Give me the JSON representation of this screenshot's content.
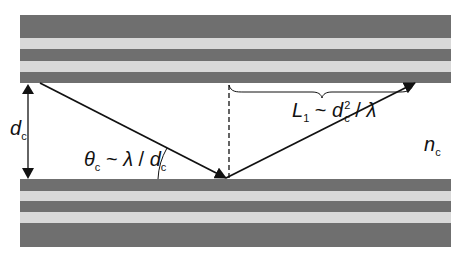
{
  "diagram": {
    "colors": {
      "dark_layer": "#6f6f6f",
      "light_layer": "#d9d9d9",
      "line": "#111111",
      "background": "#ffffff"
    },
    "top_cladding": {
      "layers": [
        {
          "type": "dark",
          "y": 15,
          "h": 23
        },
        {
          "type": "light",
          "y": 38,
          "h": 11
        },
        {
          "type": "dark",
          "y": 49,
          "h": 12
        },
        {
          "type": "light",
          "y": 61,
          "h": 11
        },
        {
          "type": "dark",
          "y": 72,
          "h": 11
        }
      ]
    },
    "bottom_cladding": {
      "layers": [
        {
          "type": "dark",
          "y": 179,
          "h": 12
        },
        {
          "type": "light",
          "y": 191,
          "h": 10
        },
        {
          "type": "dark",
          "y": 201,
          "h": 11
        },
        {
          "type": "light",
          "y": 212,
          "h": 11
        },
        {
          "type": "dark",
          "y": 223,
          "h": 24
        }
      ]
    },
    "labels": {
      "core_thickness": {
        "main": "d",
        "sub": "c"
      },
      "angle": {
        "theta": "θ",
        "theta_sub": "c",
        "tilde": " ~ ",
        "lambda": "λ",
        "slash": " / ",
        "d": "d",
        "d_sub": "c"
      },
      "length": {
        "L": "L",
        "L_sub": "1",
        "tilde": " ~ ",
        "d": "d",
        "d_sup": "2",
        "d_sub": "c",
        "slash": " / ",
        "lambda": "λ"
      },
      "core_index": {
        "main": "n",
        "sub": "c"
      }
    }
  }
}
